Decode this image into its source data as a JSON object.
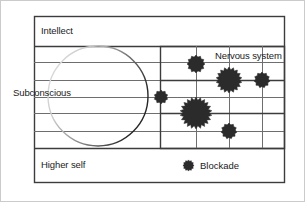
{
  "figure": {
    "type": "diagram",
    "title": "",
    "background_color": "#ffffff",
    "outer_border_color": "#c9c9c9",
    "frame_color": "#3c3c3c",
    "grid_line_color": "#6e6e6e",
    "marker_color": "#2b2b2b",
    "circle_stroke_dark": "#2b2b2b",
    "circle_stroke_light": "#d8d8d8",
    "width": 305,
    "height": 202
  },
  "zones": {
    "intellect": "Intellect",
    "subconscious": "Subconscious",
    "higher_self": "Higher self",
    "nervous_system": "Nervous system"
  },
  "legend": {
    "marker_name": "blockade-marker",
    "label": "Blockade"
  },
  "frame": {
    "x": 34,
    "y": 16,
    "width": 251,
    "height": 167
  },
  "horizontal_lines_y": [
    46,
    62,
    80,
    97,
    113,
    131,
    148
  ],
  "nervous_grid": {
    "x": 160,
    "y": 46,
    "width": 125,
    "height": 102,
    "vertical_lines_x": [
      196,
      229,
      262
    ],
    "horizontal_lines_y": [
      62,
      80,
      97,
      113,
      131
    ]
  },
  "subconscious_circle": {
    "cx": 98,
    "cy": 96,
    "r": 50
  },
  "blockades": [
    {
      "id": "blockade-1",
      "cx": 161,
      "cy": 97,
      "r": 7,
      "size": "small"
    },
    {
      "id": "blockade-2",
      "cx": 196,
      "cy": 64,
      "r": 9,
      "size": "small"
    },
    {
      "id": "blockade-3",
      "cx": 229,
      "cy": 80,
      "r": 13,
      "size": "large"
    },
    {
      "id": "blockade-4",
      "cx": 262,
      "cy": 80,
      "r": 8,
      "size": "small"
    },
    {
      "id": "blockade-5",
      "cx": 196,
      "cy": 113,
      "r": 16,
      "size": "large"
    },
    {
      "id": "blockade-6",
      "cx": 229,
      "cy": 131,
      "r": 8,
      "size": "small"
    }
  ]
}
